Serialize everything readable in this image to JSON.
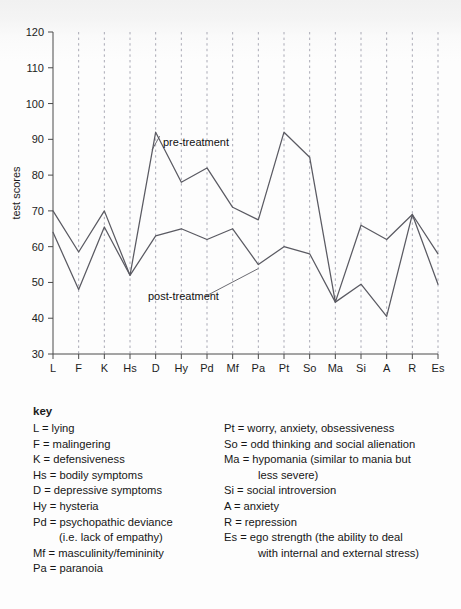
{
  "chart_data": {
    "type": "line",
    "title": "",
    "xlabel": "",
    "ylabel": "test scores",
    "ylim": [
      30,
      120
    ],
    "ytick_step": 10,
    "yticks": [
      30,
      40,
      50,
      60,
      70,
      80,
      90,
      100,
      110,
      120
    ],
    "grid": "vertical-dashed",
    "legend": "inline-annotations",
    "categories": [
      "L",
      "F",
      "K",
      "Hs",
      "D",
      "Hy",
      "Pd",
      "Mf",
      "Pa",
      "Pt",
      "So",
      "Ma",
      "Si",
      "A",
      "R",
      "Es"
    ],
    "series": [
      {
        "name": "pre-treatment",
        "values": [
          70,
          58.5,
          70,
          52,
          92,
          78,
          82,
          71,
          67.5,
          92,
          85,
          44.5,
          66,
          62,
          69,
          58
        ]
      },
      {
        "name": "post-treatment",
        "values": [
          64,
          48,
          65.5,
          52,
          63,
          65,
          62,
          65,
          55,
          60,
          58,
          44.5,
          49.5,
          40.5,
          69,
          49.5
        ]
      }
    ],
    "annotations": [
      {
        "text": "pre-treatment",
        "anchor_category": "D",
        "anchor_value": 92
      },
      {
        "text": "post-treatment",
        "anchor_category": "Pa",
        "anchor_value": 55
      }
    ],
    "line_color": "#5a5a62",
    "grid_color": "#a9a9b5",
    "axis_color": "#4a4a4a"
  },
  "key": {
    "title": "key",
    "left_column": [
      {
        "text": "L = lying"
      },
      {
        "text": "F = malingering"
      },
      {
        "text": "K = defensiveness"
      },
      {
        "text": "Hs = bodily symptoms"
      },
      {
        "text": "D = depressive symptoms"
      },
      {
        "text": "Hy = hysteria"
      },
      {
        "text": "Pd = psychopathic deviance",
        "continuation": "(i.e. lack of empathy)"
      },
      {
        "text": "Mf = masculinity/femininity"
      },
      {
        "text": "Pa = paranoia"
      }
    ],
    "right_column": [
      {
        "text": "Pt = worry, anxiety, obsessiveness"
      },
      {
        "text": "So = odd thinking and social alienation"
      },
      {
        "text": "Ma = hypomania (similar to mania but",
        "continuation": "less severe)"
      },
      {
        "text": "Si = social introversion"
      },
      {
        "text": "A = anxiety"
      },
      {
        "text": "R = repression"
      },
      {
        "text": "Es = ego strength (the ability to deal",
        "continuation": "with internal and external stress)"
      }
    ]
  }
}
